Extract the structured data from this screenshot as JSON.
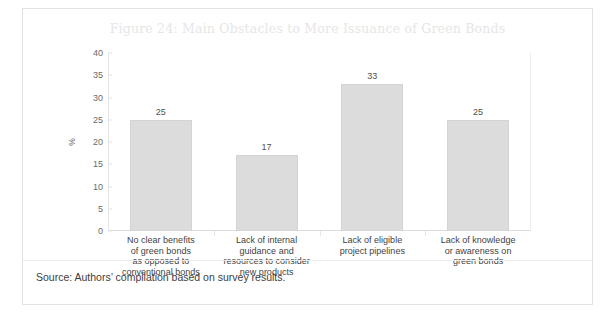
{
  "figure": {
    "title": "Figure 24: Main Obstacles to More Issuance of Green Bonds",
    "source": "Source: Authors’ compilation based on survey results."
  },
  "chart_data": {
    "type": "bar",
    "title": "Figure 24: Main Obstacles to More Issuance of Green Bonds",
    "xlabel": "",
    "ylabel": "%",
    "ylim": [
      0,
      40
    ],
    "yticks": [
      0,
      5,
      10,
      15,
      20,
      25,
      30,
      35,
      40
    ],
    "ytick_labels": [
      "0",
      "5",
      "10",
      "15",
      "20",
      "25",
      "30",
      "35",
      "40"
    ],
    "grid": false,
    "legend": "none",
    "bar_color": "#dcdcdc",
    "categories": [
      "No clear benefits of green bonds as opposed to conventional bonds",
      "Lack of internal guidance and resources to consider new products",
      "Lack of eligible project pipelines",
      "Lack of knowledge or awareness on green bonds"
    ],
    "category_lines": [
      [
        "No clear benefits",
        "of green bonds",
        "as opposed to",
        "conventional bonds"
      ],
      [
        "Lack of internal",
        "guidance and",
        "resources to consider",
        "new products"
      ],
      [
        "Lack of eligible",
        "project pipelines"
      ],
      [
        "Lack of knowledge",
        "or awareness on",
        "green bonds"
      ]
    ],
    "values": [
      25,
      17,
      33,
      25
    ],
    "value_labels": [
      "25",
      "17",
      "33",
      "25"
    ]
  }
}
